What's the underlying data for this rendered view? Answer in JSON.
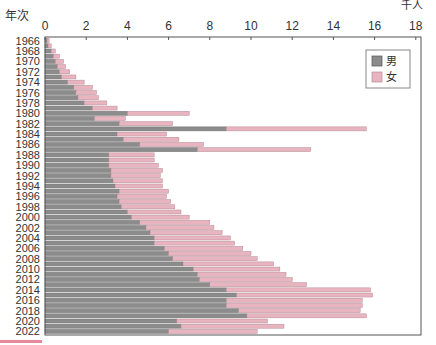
{
  "chart_data": {
    "type": "bar",
    "orientation": "horizontal",
    "stacked": true,
    "title": "",
    "xlabel": "千人",
    "ylabel": "年次",
    "xlim": [
      0,
      18
    ],
    "x_ticks": [
      0,
      2,
      4,
      6,
      8,
      10,
      12,
      14,
      16,
      18
    ],
    "grid": false,
    "legend_position": "top-right",
    "y_tick_labels": [
      "1966",
      "1968",
      "1970",
      "1972",
      "1974",
      "1976",
      "1978",
      "1980",
      "1982",
      "1984",
      "1986",
      "1988",
      "1990",
      "1992",
      "1994",
      "1996",
      "1998",
      "2000",
      "2002",
      "2004",
      "2006",
      "2008",
      "2010",
      "2012",
      "2014",
      "2016",
      "2018",
      "2020",
      "2022"
    ],
    "categories": [
      1966,
      1967,
      1968,
      1969,
      1970,
      1971,
      1972,
      1973,
      1974,
      1975,
      1976,
      1977,
      1978,
      1979,
      1980,
      1981,
      1982,
      1983,
      1984,
      1985,
      1986,
      1987,
      1988,
      1989,
      1990,
      1991,
      1992,
      1993,
      1994,
      1995,
      1996,
      1997,
      1998,
      1999,
      2000,
      2001,
      2002,
      2003,
      2004,
      2005,
      2006,
      2007,
      2008,
      2009,
      2010,
      2011,
      2012,
      2013,
      2014,
      2015,
      2016,
      2017,
      2018,
      2019,
      2020,
      2021,
      2022
    ],
    "series": [
      {
        "name": "男",
        "color": "#8c8c8c",
        "values": [
          0.1,
          0.15,
          0.3,
          0.4,
          0.5,
          0.6,
          0.7,
          0.8,
          1.1,
          1.4,
          1.5,
          1.6,
          1.9,
          2.3,
          4.0,
          2.4,
          3.6,
          8.8,
          3.5,
          3.8,
          4.6,
          7.4,
          3.1,
          3.1,
          3.1,
          3.2,
          3.2,
          3.3,
          3.4,
          3.6,
          3.5,
          3.6,
          3.7,
          4.0,
          4.2,
          4.6,
          4.9,
          5.1,
          5.3,
          5.3,
          5.8,
          6.0,
          6.2,
          6.7,
          7.2,
          7.4,
          7.5,
          8.0,
          8.8,
          9.3,
          8.8,
          8.8,
          9.4,
          9.8,
          6.4,
          6.6,
          6.0
        ]
      },
      {
        "name": "女",
        "color": "#e8b4c0",
        "values": [
          0.1,
          0.15,
          0.2,
          0.3,
          0.4,
          0.4,
          0.5,
          0.7,
          0.8,
          0.9,
          1.0,
          1.0,
          1.1,
          1.2,
          3.0,
          1.5,
          2.6,
          6.8,
          2.4,
          2.7,
          3.1,
          5.5,
          2.2,
          2.2,
          2.4,
          2.5,
          2.4,
          2.4,
          2.3,
          2.4,
          2.4,
          2.5,
          2.6,
          2.6,
          2.8,
          3.4,
          3.3,
          3.5,
          3.7,
          3.9,
          3.8,
          4.0,
          4.1,
          4.4,
          4.2,
          4.3,
          4.5,
          4.7,
          7.0,
          6.6,
          6.6,
          6.6,
          5.9,
          5.8,
          4.4,
          5.0,
          4.3
        ]
      }
    ],
    "totals": [
      0.2,
      0.3,
      0.5,
      0.7,
      0.9,
      1.0,
      1.2,
      1.5,
      1.9,
      2.3,
      2.5,
      2.6,
      3.0,
      3.5,
      7.0,
      3.9,
      6.2,
      15.6,
      5.9,
      6.5,
      7.7,
      12.9,
      5.3,
      5.3,
      5.5,
      5.7,
      5.6,
      5.7,
      5.7,
      6.0,
      5.9,
      6.1,
      6.3,
      6.6,
      7.0,
      8.0,
      8.2,
      8.6,
      9.0,
      9.2,
      9.6,
      10.0,
      10.3,
      11.1,
      11.4,
      11.7,
      12.0,
      12.7,
      15.8,
      15.9,
      15.4,
      15.4,
      15.3,
      15.6,
      10.8,
      11.6,
      10.3
    ]
  },
  "labels": {
    "y_axis_title": "年次",
    "x_unit": "千人",
    "legend": [
      {
        "label": "男",
        "color": "#8c8c8c"
      },
      {
        "label": "女",
        "color": "#e8b4c0"
      }
    ]
  }
}
